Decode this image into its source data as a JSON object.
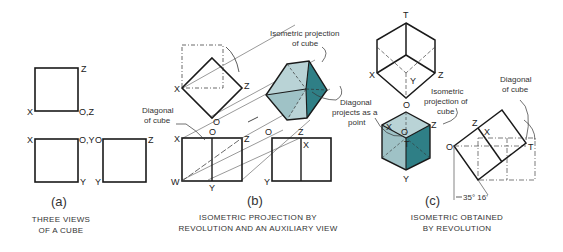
{
  "colors": {
    "line": "#1a1a1a",
    "face_light": "#b9d3d6",
    "face_mid": "#9fc2c6",
    "face_dark": "#2f7f86",
    "text": "#222222"
  },
  "panel_a": {
    "sublabel": "(a)",
    "caption_line1": "THREE VIEWS",
    "caption_line2": "OF A CUBE",
    "labels": {
      "top_z": "Z",
      "top_x": "X",
      "top_oz": "O,Z",
      "front_x": "X",
      "front_oy": "O,Y",
      "front_y": "Y",
      "side_o": "O",
      "side_y": "Y",
      "side_z": "Z"
    }
  },
  "panel_b": {
    "sublabel": "(b)",
    "caption_line1": "ISOMETRIC PROJECTION BY",
    "caption_line2": "REVOLUTION AND AN AUXILIARY VIEW",
    "note_iso_1": "Isometric projection",
    "note_iso_2": "of cube",
    "note_diag_1": "Diagonal",
    "note_diag_2": "of cube",
    "note_point_1": "Diagonal",
    "note_point_2": "projects as a",
    "note_point_3": "point",
    "labels": {
      "top_x": "X",
      "top_z": "Z",
      "top_o": "O",
      "front_x": "X",
      "front_o": "O",
      "front_z": "Z",
      "front_w": "W",
      "front_y": "Y",
      "side_o": "O",
      "side_z": "Z",
      "side_x": "X",
      "side_y": "Y",
      "hex_z": "Z"
    }
  },
  "panel_c": {
    "sublabel": "(c)",
    "caption_line1": "ISOMETRIC OBTAINED",
    "caption_line2": "BY REVOLUTION",
    "note_iso_1": "Isometric",
    "note_iso_2": "projection of",
    "note_iso_3": "cube",
    "note_diag_1": "Diagonal",
    "note_diag_2": "of cube",
    "angle": "35° 16'",
    "labels": {
      "top_t": "T",
      "top_x": "X",
      "top_y": "Y",
      "top_z": "Z",
      "top_o": "O",
      "iso_x": "X",
      "iso_o": "O",
      "iso_t": "T",
      "iso_z": "Z",
      "iso_y": "Y",
      "rev_z": "Z",
      "rev_x": "X",
      "rev_o": "O",
      "rev_t": "T"
    }
  }
}
